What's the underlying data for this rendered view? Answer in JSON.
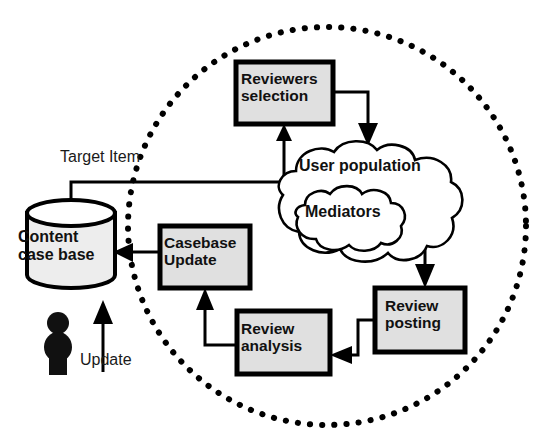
{
  "diagram": {
    "colors": {
      "stroke": "#000000",
      "box_fill": "#e0e0e0",
      "cylinder_fill": "#ededed",
      "cloud_fill": "#ffffff",
      "background": "#ffffff",
      "person": "#111111",
      "dotted_boundary": "#000000"
    },
    "boundary": {
      "name": "system-boundary",
      "shape": "dotted-circle",
      "cx": 327,
      "cy": 226,
      "rx": 199,
      "ry": 199
    },
    "nodes": [
      {
        "id": "reviewers-selection",
        "label": "Reviewers\nselection",
        "shape": "process-box",
        "x": 236,
        "y": 62,
        "w": 97,
        "h": 62
      },
      {
        "id": "casebase-update",
        "label": "Casebase\nUpdate",
        "shape": "process-box",
        "x": 160,
        "y": 226,
        "w": 90,
        "h": 62
      },
      {
        "id": "review-analysis",
        "label": "Review\nanalysis",
        "shape": "process-box",
        "x": 237,
        "y": 311,
        "w": 93,
        "h": 63
      },
      {
        "id": "review-posting",
        "label": "Review\nposting",
        "shape": "process-box",
        "x": 375,
        "y": 288,
        "w": 90,
        "h": 64
      },
      {
        "id": "content-case-base",
        "label": "Content\ncase base",
        "shape": "cylinder",
        "x": 27,
        "y": 200,
        "w": 88,
        "h": 88
      },
      {
        "id": "user-population",
        "label": "User population",
        "shape": "cloud",
        "x": 268,
        "y": 142,
        "w": 198,
        "h": 122
      },
      {
        "id": "mediators",
        "label": "Mediators",
        "shape": "cloud",
        "x": 284,
        "y": 192,
        "w": 138,
        "h": 62
      },
      {
        "id": "user-actor",
        "label": "",
        "shape": "person",
        "x": 44,
        "y": 312,
        "w": 30,
        "h": 60
      }
    ],
    "edges": [
      {
        "id": "target-item",
        "label": "Target Item",
        "from": "content-case-base",
        "to": "reviewers-selection"
      },
      {
        "id": "update",
        "label": "Update",
        "from": "user-actor",
        "to": "content-case-base"
      },
      {
        "id": "selection-to-users",
        "label": "",
        "from": "reviewers-selection",
        "to": "user-population"
      },
      {
        "id": "mediators-to-posting",
        "label": "",
        "from": "mediators",
        "to": "review-posting"
      },
      {
        "id": "posting-to-analysis",
        "label": "",
        "from": "review-posting",
        "to": "review-analysis"
      },
      {
        "id": "analysis-to-casebase",
        "label": "",
        "from": "review-analysis",
        "to": "casebase-update"
      },
      {
        "id": "casebase-to-content",
        "label": "",
        "from": "casebase-update",
        "to": "content-case-base"
      }
    ],
    "labels": {
      "target_item": "Target Item",
      "update": "Update",
      "content_case_base": "Content\ncase base",
      "user_population": "User population",
      "mediators": "Mediators",
      "reviewers_selection": "Reviewers\nselection",
      "casebase_update": "Casebase\nUpdate",
      "review_analysis": "Review\nanalysis",
      "review_posting": "Review\nposting"
    }
  }
}
